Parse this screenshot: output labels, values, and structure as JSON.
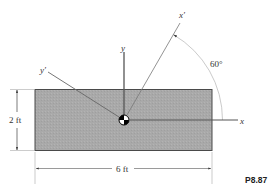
{
  "figure": {
    "label": "P8.87",
    "width_dimension": "6 ft",
    "height_dimension": "2 ft",
    "angle_label": "60°",
    "angle_degrees": 60,
    "axes": {
      "x": "x",
      "y": "y",
      "x_prime": "x′",
      "y_prime": "y′"
    },
    "colors": {
      "plate_fill": "#a9a9a9",
      "plate_stroke": "#555555",
      "line": "#555555"
    }
  }
}
